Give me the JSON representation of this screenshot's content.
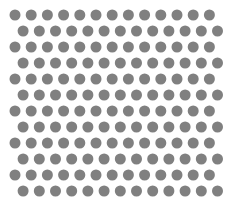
{
  "canvas": {
    "width": 227,
    "height": 224,
    "background_color": "#ffffff"
  },
  "pattern": {
    "name": "staggered-dot-lattice",
    "dot_color": "#808080",
    "dot_diameter": 11,
    "dot_radius": 5.5,
    "column_pitch": 16.2,
    "row_pitch": 16,
    "columns_per_row": 13,
    "row_count": 12,
    "origin_x": 15,
    "origin_y": 15,
    "stagger_offset_x": 8.1,
    "row_offsets": [
      0,
      1,
      0,
      1,
      0,
      1,
      0,
      1,
      0,
      1,
      0,
      1
    ],
    "row_centers_y": [
      15,
      31,
      47,
      63,
      79,
      95,
      111,
      127,
      143,
      159,
      175,
      191
    ],
    "margins": {
      "left": 9,
      "top": 9,
      "right": 10,
      "bottom": 25
    }
  }
}
